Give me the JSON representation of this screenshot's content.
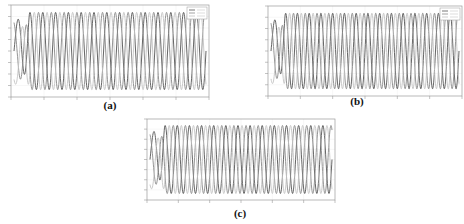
{
  "figure": {
    "panels": [
      {
        "id": "a",
        "caption": "(a)"
      },
      {
        "id": "b",
        "caption": "(b)"
      },
      {
        "id": "c",
        "caption": "(c)"
      }
    ]
  },
  "colors": {
    "phase_dark": "#555555",
    "phase_mid": "#8a8a8a",
    "phase_light": "#c4c4c4",
    "frame": "#9a9a9a",
    "grid": "#eeeeee"
  },
  "chart_data": [
    {
      "type": "line",
      "title": "",
      "caption": "(a)",
      "xlabel": "",
      "ylabel": "",
      "grid": true,
      "legend": {
        "position": "upper right",
        "entries": 3
      },
      "series": [
        {
          "name": "phase 1",
          "cycles": 15,
          "phase_deg": 0,
          "transient": true
        },
        {
          "name": "phase 2",
          "cycles": 15,
          "phase_deg": 120,
          "transient": true
        },
        {
          "name": "phase 3",
          "cycles": 15,
          "phase_deg": 240,
          "transient": true
        }
      ],
      "x_ticks": 7,
      "y_ticks": 9,
      "ylim": [
        -1,
        1
      ]
    },
    {
      "type": "line",
      "title": "",
      "caption": "(b)",
      "xlabel": "",
      "ylabel": "",
      "grid": true,
      "legend": {
        "position": "upper right",
        "entries": 3
      },
      "series": [
        {
          "name": "phase 1",
          "cycles": 16,
          "phase_deg": 0,
          "transient": true
        },
        {
          "name": "phase 2",
          "cycles": 16,
          "phase_deg": 120,
          "transient": true
        },
        {
          "name": "phase 3",
          "cycles": 16,
          "phase_deg": 240,
          "transient": true
        }
      ],
      "x_ticks": 7,
      "y_ticks": 9,
      "ylim": [
        -1,
        1
      ]
    },
    {
      "type": "line",
      "title": "",
      "caption": "(c)",
      "xlabel": "",
      "ylabel": "",
      "grid": true,
      "legend": {
        "position": "none",
        "entries": 0
      },
      "series": [
        {
          "name": "phase 1",
          "cycles": 15,
          "phase_deg": 0,
          "transient": true
        },
        {
          "name": "phase 2",
          "cycles": 15,
          "phase_deg": 120,
          "transient": true
        },
        {
          "name": "phase 3",
          "cycles": 15,
          "phase_deg": 240,
          "transient": true
        }
      ],
      "x_ticks": 7,
      "y_ticks": 9,
      "ylim": [
        -1,
        1
      ]
    }
  ]
}
